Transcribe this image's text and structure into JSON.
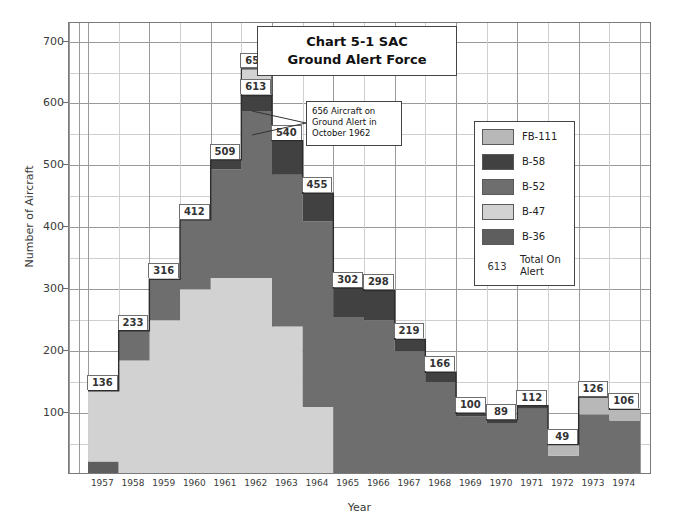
{
  "title": {
    "line1": "Chart 5-1 SAC",
    "line2": "Ground Alert Force"
  },
  "annotation": {
    "text": "656 Aircraft on Ground Alert in October 1962"
  },
  "legend": {
    "items": [
      {
        "label": "FB-111",
        "color": "#b8b8b8"
      },
      {
        "label": "B-58",
        "color": "#414141"
      },
      {
        "label": "B-52",
        "color": "#6e6e6e"
      },
      {
        "label": "B-47",
        "color": "#d2d2d2"
      },
      {
        "label": "B-36",
        "color": "#5e5e5e"
      }
    ],
    "total_number": "613",
    "total_label": "Total On Alert"
  },
  "chart_data": {
    "type": "area",
    "title": "Chart 5-1 SAC Ground Alert Force",
    "xlabel": "Year",
    "ylabel": "Number of Aircraft",
    "ylim": [
      0,
      730
    ],
    "yticks": [
      100,
      200,
      300,
      400,
      500,
      600,
      700
    ],
    "yminor_step": 50,
    "grid": true,
    "legend_position": "right-inside",
    "stacked": true,
    "categories": [
      "1957",
      "1958",
      "1959",
      "1960",
      "1961",
      "1962",
      "1963",
      "1964",
      "1965",
      "1966",
      "1967",
      "1968",
      "1969",
      "1970",
      "1971",
      "1972",
      "1973",
      "1974"
    ],
    "series": [
      {
        "name": "B-36",
        "color": "#5e5e5e",
        "values": [
          22,
          0,
          0,
          0,
          0,
          0,
          0,
          0,
          0,
          0,
          0,
          0,
          0,
          0,
          0,
          0,
          0,
          0
        ]
      },
      {
        "name": "B-47",
        "color": "#d2d2d2",
        "values": [
          114,
          185,
          250,
          300,
          318,
          318,
          240,
          110,
          0,
          0,
          0,
          0,
          0,
          0,
          0,
          0,
          0,
          0
        ]
      },
      {
        "name": "B-52",
        "color": "#6e6e6e",
        "values": [
          0,
          48,
          66,
          112,
          176,
          270,
          245,
          300,
          255,
          250,
          200,
          150,
          95,
          84,
          107,
          31,
          98,
          88
        ]
      },
      {
        "name": "B-58",
        "color": "#414141",
        "values": [
          0,
          0,
          0,
          0,
          15,
          25,
          55,
          45,
          47,
          48,
          19,
          16,
          5,
          5,
          5,
          0,
          0,
          0
        ]
      },
      {
        "name": "FB-111",
        "color": "#b8b8b8",
        "values": [
          0,
          0,
          0,
          0,
          0,
          0,
          0,
          0,
          0,
          0,
          0,
          0,
          0,
          0,
          0,
          18,
          28,
          18
        ]
      }
    ],
    "totals": [
      136,
      233,
      316,
      412,
      509,
      613,
      540,
      455,
      302,
      298,
      219,
      166,
      100,
      89,
      112,
      49,
      126,
      106
    ],
    "peak_marker": {
      "year": "1962",
      "value": 656,
      "label": "656"
    },
    "data_labels": [
      {
        "year": "1957",
        "value": 136
      },
      {
        "year": "1958",
        "value": 233
      },
      {
        "year": "1959",
        "value": 316
      },
      {
        "year": "1960",
        "value": 412
      },
      {
        "year": "1961",
        "value": 509
      },
      {
        "year": "1962",
        "value": 613
      },
      {
        "year": "1963",
        "value": 540
      },
      {
        "year": "1964",
        "value": 455
      },
      {
        "year": "1965",
        "value": 302
      },
      {
        "year": "1966",
        "value": 298
      },
      {
        "year": "1967",
        "value": 219
      },
      {
        "year": "1968",
        "value": 166
      },
      {
        "year": "1969",
        "value": 100
      },
      {
        "year": "1970",
        "value": 89
      },
      {
        "year": "1971",
        "value": 112
      },
      {
        "year": "1972",
        "value": 49
      },
      {
        "year": "1973",
        "value": 126
      },
      {
        "year": "1974",
        "value": 106
      }
    ]
  }
}
